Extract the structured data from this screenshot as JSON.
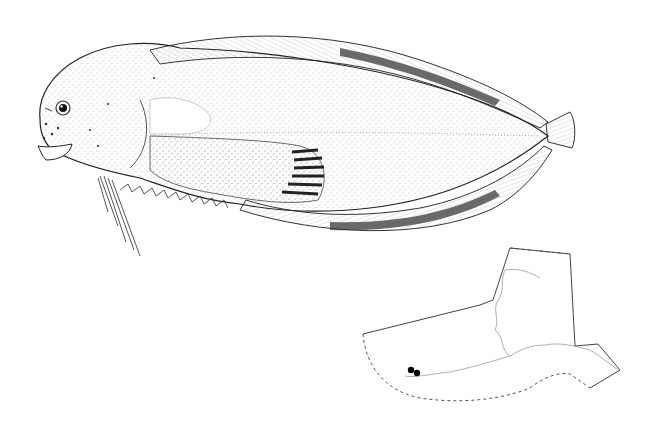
{
  "figure": {
    "view": "lateral"
  },
  "map": {
    "subject": "distribution map",
    "region": "Alaska and adjacent waters",
    "records": [
      {
        "label": "occurrence-1"
      },
      {
        "label": "occurrence-2"
      }
    ]
  },
  "colors": {
    "ink": "#222222",
    "stipple": "#555555",
    "band": "#3a3a3a",
    "background": "#ffffff",
    "map_line": "#444444",
    "coast": "#9a9a9a",
    "marker": "#000000"
  }
}
